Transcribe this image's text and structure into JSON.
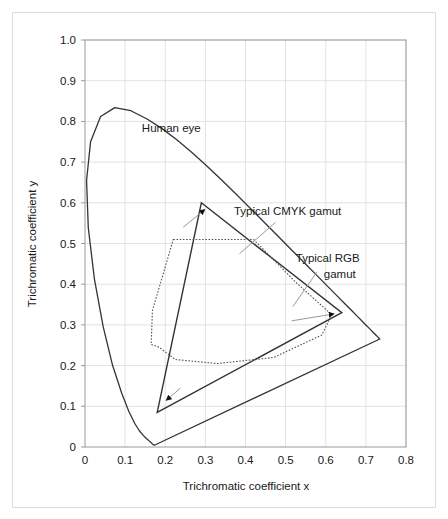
{
  "figure": {
    "background_color": "#ffffff",
    "frame_color": "#dcdcdc",
    "grid_color": "#e2e2e2",
    "axis_color": "#9a9a9a",
    "curve_color": "#333333"
  },
  "chart_data": {
    "type": "line",
    "title": "",
    "subtitle": "",
    "xlabel": "Trichromatic coefficient x",
    "ylabel": "Trichromatic coefficient y",
    "xlim": [
      0,
      0.8
    ],
    "ylim": [
      0,
      1.0
    ],
    "xticks": [
      0,
      0.1,
      0.2,
      0.3,
      0.4,
      0.5,
      0.6,
      0.7,
      0.8
    ],
    "xtick_labels": [
      "0",
      "0.1",
      "0.2",
      "0.3",
      "0.4",
      "0.5",
      "0.6",
      "0.7",
      "0.8"
    ],
    "yticks": [
      0,
      0.1,
      0.2,
      0.3,
      0.4,
      0.5,
      0.6,
      0.7,
      0.8,
      0.9,
      1.0
    ],
    "ytick_labels": [
      "0",
      "0.1",
      "0.2",
      "0.3",
      "0.4",
      "0.5",
      "0.6",
      "0.7",
      "0.8",
      "0.9",
      "1.0"
    ],
    "grid": true,
    "legend": "none",
    "series": [
      {
        "name": "Human eye",
        "style": "solid-closed-curve",
        "description": "CIE 1931 spectral locus with purple line",
        "points": [
          [
            0.1741,
            0.005
          ],
          [
            0.174,
            0.005
          ],
          [
            0.1738,
            0.0049
          ],
          [
            0.1736,
            0.0049
          ],
          [
            0.1733,
            0.0048
          ],
          [
            0.173,
            0.0048
          ],
          [
            0.1726,
            0.0048
          ],
          [
            0.1721,
            0.0048
          ],
          [
            0.1714,
            0.0051
          ],
          [
            0.1703,
            0.0058
          ],
          [
            0.1689,
            0.0069
          ],
          [
            0.1669,
            0.0086
          ],
          [
            0.1644,
            0.0109
          ],
          [
            0.1611,
            0.0138
          ],
          [
            0.1566,
            0.0177
          ],
          [
            0.151,
            0.0227
          ],
          [
            0.144,
            0.0297
          ],
          [
            0.1355,
            0.0399
          ],
          [
            0.1241,
            0.0578
          ],
          [
            0.1096,
            0.0868
          ],
          [
            0.0913,
            0.1327
          ],
          [
            0.0687,
            0.2007
          ],
          [
            0.0454,
            0.295
          ],
          [
            0.0235,
            0.4127
          ],
          [
            0.0082,
            0.5384
          ],
          [
            0.0039,
            0.6548
          ],
          [
            0.0139,
            0.7502
          ],
          [
            0.0389,
            0.812
          ],
          [
            0.0743,
            0.8338
          ],
          [
            0.1142,
            0.8262
          ],
          [
            0.1547,
            0.8059
          ],
          [
            0.1929,
            0.7816
          ],
          [
            0.2296,
            0.7543
          ],
          [
            0.2658,
            0.7243
          ],
          [
            0.3016,
            0.6923
          ],
          [
            0.3373,
            0.6589
          ],
          [
            0.3731,
            0.6245
          ],
          [
            0.4087,
            0.5896
          ],
          [
            0.4441,
            0.5547
          ],
          [
            0.4788,
            0.5202
          ],
          [
            0.5125,
            0.4866
          ],
          [
            0.5448,
            0.4544
          ],
          [
            0.5752,
            0.4242
          ],
          [
            0.6029,
            0.3965
          ],
          [
            0.627,
            0.3725
          ],
          [
            0.6482,
            0.3514
          ],
          [
            0.6658,
            0.334
          ],
          [
            0.6801,
            0.3197
          ],
          [
            0.6915,
            0.3083
          ],
          [
            0.7006,
            0.2993
          ],
          [
            0.7079,
            0.292
          ],
          [
            0.714,
            0.2859
          ],
          [
            0.719,
            0.2809
          ],
          [
            0.723,
            0.277
          ],
          [
            0.726,
            0.274
          ],
          [
            0.7283,
            0.2717
          ],
          [
            0.73,
            0.27
          ],
          [
            0.7311,
            0.2689
          ],
          [
            0.732,
            0.268
          ],
          [
            0.7327,
            0.2673
          ],
          [
            0.7334,
            0.2666
          ],
          [
            0.734,
            0.266
          ],
          [
            0.7344,
            0.2656
          ],
          [
            0.7346,
            0.2654
          ],
          [
            0.7347,
            0.2653
          ]
        ]
      },
      {
        "name": "Typical RGB gamut",
        "style": "solid-triangle",
        "vertices": [
          [
            0.29,
            0.6
          ],
          [
            0.64,
            0.33
          ],
          [
            0.18,
            0.085
          ]
        ]
      },
      {
        "name": "Typical CMYK gamut",
        "style": "dotted-polygon",
        "vertices": [
          [
            0.22,
            0.51
          ],
          [
            0.42,
            0.51
          ],
          [
            0.525,
            0.405
          ],
          [
            0.615,
            0.325
          ],
          [
            0.59,
            0.275
          ],
          [
            0.47,
            0.22
          ],
          [
            0.33,
            0.205
          ],
          [
            0.225,
            0.215
          ],
          [
            0.185,
            0.245
          ],
          [
            0.165,
            0.252
          ],
          [
            0.168,
            0.335
          ]
        ]
      }
    ],
    "annotations": [
      {
        "text": "Human eye",
        "x": 0.215,
        "y": 0.775,
        "leader": false
      },
      {
        "text": "Typical CMYK gamut",
        "x": 0.505,
        "y": 0.57,
        "leader": true
      },
      {
        "text": "Typical RGB",
        "x": 0.605,
        "y": 0.455,
        "leader": true
      },
      {
        "text": "gamut",
        "x": 0.635,
        "y": 0.415,
        "leader": false
      }
    ],
    "arrows": [
      {
        "label": "to-rgb-green-edge",
        "from": [
          0.245,
          0.54
        ],
        "to": [
          0.298,
          0.583
        ]
      },
      {
        "label": "to-rgb-red-vertex",
        "from": [
          0.515,
          0.31
        ],
        "to": [
          0.62,
          0.327
        ]
      },
      {
        "label": "to-rgb-blue-edge",
        "from": [
          0.238,
          0.145
        ],
        "to": [
          0.203,
          0.115
        ]
      }
    ]
  }
}
